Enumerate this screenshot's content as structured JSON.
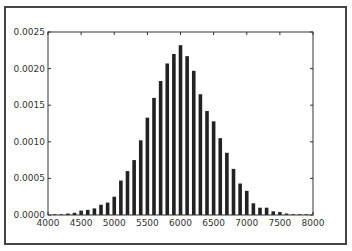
{
  "chart_data": {
    "type": "bar",
    "title": "",
    "xlabel": "",
    "ylabel": "",
    "xlim": [
      4000,
      8000
    ],
    "ylim": [
      0,
      0.0025
    ],
    "xticks": [
      "4000",
      "4500",
      "5000",
      "5500",
      "6000",
      "6500",
      "7000",
      "7500",
      "8000"
    ],
    "yticks": [
      "0.0000",
      "0.0005",
      "0.0010",
      "0.0015",
      "0.0020",
      "0.0025"
    ],
    "grid": false,
    "bar_color": "#222222",
    "x": [
      4100,
      4200,
      4300,
      4400,
      4500,
      4600,
      4700,
      4800,
      4900,
      5000,
      5100,
      5200,
      5300,
      5400,
      5500,
      5600,
      5700,
      5800,
      5900,
      6000,
      6100,
      6200,
      6300,
      6400,
      6500,
      6600,
      6700,
      6800,
      6900,
      7000,
      7100,
      7200,
      7300,
      7400,
      7500,
      7600,
      7700,
      7800,
      7900
    ],
    "values": [
      1e-05,
      1e-05,
      2e-05,
      3e-05,
      6e-05,
      7e-05,
      9e-05,
      0.00014,
      0.00017,
      0.00025,
      0.00047,
      0.0006,
      0.00075,
      0.00102,
      0.00133,
      0.0016,
      0.00183,
      0.00207,
      0.0022,
      0.00232,
      0.00217,
      0.00197,
      0.00165,
      0.00142,
      0.00128,
      0.00105,
      0.00085,
      0.00063,
      0.00043,
      0.00033,
      0.00016,
      0.0001,
      0.0001,
      5e-05,
      4e-05,
      2e-05,
      1e-05,
      1e-05,
      1e-05
    ]
  }
}
